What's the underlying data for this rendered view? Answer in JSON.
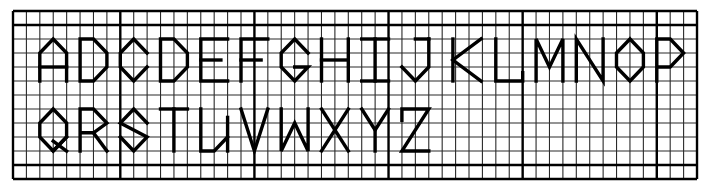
{
  "grid": {
    "left": 13,
    "top": 11,
    "cols": 51,
    "rows": 12,
    "cell_w": 13.412,
    "cell_h": 14,
    "heavy_cols": [
      0,
      8,
      18,
      28,
      38,
      48,
      51
    ],
    "heavy_rows": [
      0,
      1,
      11,
      12
    ],
    "line_color": "#2a2a2a",
    "heavy_color": "#000000",
    "stroke_color": "#000000"
  },
  "rows": [
    {
      "label": "row-1",
      "letters": "ABCDEFGHIJKLMNOP"
    },
    {
      "label": "row-2",
      "letters": "QRSTUVWXYZ"
    }
  ],
  "glyphs": [
    {
      "ch": "A",
      "c": 2,
      "r": 2,
      "paths": [
        [
          [
            0,
            3
          ],
          [
            0,
            1
          ],
          [
            1,
            0
          ],
          [
            2,
            1
          ],
          [
            2,
            3
          ]
        ],
        [
          [
            0,
            2
          ],
          [
            2,
            2
          ]
        ]
      ]
    },
    {
      "ch": "B",
      "c": 5,
      "r": 2,
      "paths": [
        [
          [
            0,
            0
          ],
          [
            0,
            3
          ],
          [
            1,
            3
          ],
          [
            2,
            2
          ],
          [
            2,
            1
          ],
          [
            1,
            0
          ],
          [
            0,
            0
          ]
        ]
      ]
    },
    {
      "ch": "C",
      "c": 8,
      "r": 2,
      "paths": [
        [
          [
            2,
            1
          ],
          [
            1,
            0
          ],
          [
            0,
            1
          ],
          [
            0,
            2
          ],
          [
            1,
            3
          ],
          [
            2,
            2
          ]
        ]
      ]
    },
    {
      "ch": "D",
      "c": 11,
      "r": 2,
      "paths": [
        [
          [
            0,
            0
          ],
          [
            0,
            3
          ],
          [
            1,
            3
          ],
          [
            2,
            2
          ],
          [
            2,
            1
          ],
          [
            1,
            0
          ],
          [
            0,
            0
          ]
        ]
      ]
    },
    {
      "ch": "E",
      "c": 14,
      "r": 2,
      "paths": [
        [
          [
            2,
            0
          ],
          [
            0,
            0
          ],
          [
            0,
            3
          ],
          [
            2,
            3
          ]
        ],
        [
          [
            0,
            1.5
          ],
          [
            1.5,
            1.5
          ]
        ]
      ]
    },
    {
      "ch": "F",
      "c": 17,
      "r": 2,
      "paths": [
        [
          [
            2,
            0
          ],
          [
            0,
            0
          ],
          [
            0,
            3
          ]
        ],
        [
          [
            0,
            1.5
          ],
          [
            1.5,
            1.5
          ]
        ]
      ]
    },
    {
      "ch": "G",
      "c": 20,
      "r": 2,
      "paths": [
        [
          [
            2,
            1
          ],
          [
            1,
            0
          ],
          [
            0,
            1
          ],
          [
            0,
            2
          ],
          [
            1,
            3
          ],
          [
            2,
            2
          ],
          [
            1,
            2
          ]
        ]
      ]
    },
    {
      "ch": "H",
      "c": 23,
      "r": 2,
      "paths": [
        [
          [
            0,
            0
          ],
          [
            0,
            3
          ]
        ],
        [
          [
            2,
            0
          ],
          [
            2,
            3
          ]
        ],
        [
          [
            0,
            1.5
          ],
          [
            2,
            1.5
          ]
        ]
      ]
    },
    {
      "ch": "I",
      "c": 26,
      "r": 2,
      "paths": [
        [
          [
            0,
            0
          ],
          [
            2,
            0
          ]
        ],
        [
          [
            1,
            0
          ],
          [
            1,
            3
          ]
        ],
        [
          [
            0,
            3
          ],
          [
            2,
            3
          ]
        ]
      ]
    },
    {
      "ch": "J",
      "c": 29,
      "r": 2,
      "paths": [
        [
          [
            1,
            0
          ],
          [
            2,
            0
          ]
        ],
        [
          [
            2,
            0
          ],
          [
            2,
            2
          ],
          [
            1,
            3
          ],
          [
            0,
            2
          ]
        ]
      ]
    },
    {
      "ch": "K",
      "c": 33,
      "r": 2,
      "paths": [
        [
          [
            -0.2,
            0
          ],
          [
            -0.2,
            3
          ]
        ],
        [
          [
            1.9,
            0
          ],
          [
            -0.2,
            1.5
          ],
          [
            1.9,
            3
          ]
        ]
      ]
    },
    {
      "ch": "L",
      "c": 36,
      "r": 2,
      "paths": [
        [
          [
            0,
            0
          ],
          [
            0,
            3
          ],
          [
            2,
            3
          ],
          [
            2,
            2.4
          ]
        ]
      ]
    },
    {
      "ch": "M",
      "c": 39,
      "r": 2,
      "paths": [
        [
          [
            0,
            3
          ],
          [
            0,
            0
          ],
          [
            1,
            2
          ],
          [
            2,
            0
          ],
          [
            2,
            3
          ]
        ]
      ]
    },
    {
      "ch": "N",
      "c": 42,
      "r": 2,
      "paths": [
        [
          [
            0,
            3
          ],
          [
            0,
            0
          ],
          [
            2,
            3
          ],
          [
            2,
            0
          ]
        ]
      ]
    },
    {
      "ch": "O",
      "c": 45,
      "r": 2,
      "paths": [
        [
          [
            1,
            0
          ],
          [
            2,
            1
          ],
          [
            2,
            2
          ],
          [
            1,
            3
          ],
          [
            0,
            2
          ],
          [
            0,
            1
          ],
          [
            1,
            0
          ]
        ]
      ]
    },
    {
      "ch": "P",
      "c": 48,
      "r": 2,
      "paths": [
        [
          [
            0,
            3
          ],
          [
            0,
            0
          ],
          [
            1,
            0
          ],
          [
            2,
            1
          ],
          [
            1,
            2
          ],
          [
            0,
            2
          ]
        ]
      ]
    },
    {
      "ch": "Q",
      "c": 2,
      "r": 7,
      "paths": [
        [
          [
            1,
            0
          ],
          [
            2,
            1
          ],
          [
            2,
            2
          ],
          [
            1,
            3
          ],
          [
            0,
            2
          ],
          [
            0,
            1
          ],
          [
            1,
            0
          ]
        ],
        [
          [
            1,
            3
          ],
          [
            2,
            2
          ]
        ],
        [
          [
            1,
            2.3
          ],
          [
            2,
            3
          ]
        ]
      ]
    },
    {
      "ch": "R",
      "c": 5,
      "r": 7,
      "paths": [
        [
          [
            0,
            3
          ],
          [
            0,
            0
          ],
          [
            1,
            0
          ],
          [
            2,
            1
          ],
          [
            1,
            1.7
          ],
          [
            0,
            1.7
          ]
        ],
        [
          [
            1,
            1.7
          ],
          [
            2,
            3
          ]
        ]
      ]
    },
    {
      "ch": "S",
      "c": 8,
      "r": 7,
      "paths": [
        [
          [
            2,
            1
          ],
          [
            1,
            0
          ],
          [
            0,
            1
          ],
          [
            2,
            2
          ],
          [
            1,
            3
          ],
          [
            0,
            2
          ]
        ]
      ]
    },
    {
      "ch": "T",
      "c": 11,
      "r": 7,
      "paths": [
        [
          [
            0,
            0
          ],
          [
            2,
            0
          ]
        ],
        [
          [
            1,
            0
          ],
          [
            1,
            3
          ]
        ]
      ]
    },
    {
      "ch": "U",
      "c": 14,
      "r": 7,
      "paths": [
        [
          [
            0,
            0
          ],
          [
            0,
            3
          ],
          [
            1,
            3
          ],
          [
            2,
            2
          ]
        ],
        [
          [
            2,
            0.6
          ],
          [
            2,
            3
          ]
        ]
      ]
    },
    {
      "ch": "V",
      "c": 17,
      "r": 7,
      "paths": [
        [
          [
            0,
            0
          ],
          [
            1,
            3
          ],
          [
            2,
            0
          ]
        ]
      ]
    },
    {
      "ch": "W",
      "c": 20,
      "r": 7,
      "paths": [
        [
          [
            0,
            0
          ],
          [
            0,
            3
          ],
          [
            1,
            1
          ],
          [
            2,
            3
          ],
          [
            2,
            0
          ]
        ]
      ]
    },
    {
      "ch": "X",
      "c": 23,
      "r": 7,
      "paths": [
        [
          [
            0,
            0
          ],
          [
            2,
            3
          ]
        ],
        [
          [
            2,
            0
          ],
          [
            0,
            3
          ]
        ]
      ]
    },
    {
      "ch": "Y",
      "c": 26,
      "r": 7,
      "paths": [
        [
          [
            0,
            0
          ],
          [
            1,
            1.5
          ],
          [
            2,
            0
          ]
        ],
        [
          [
            1,
            1.5
          ],
          [
            1,
            3
          ]
        ]
      ]
    },
    {
      "ch": "Z",
      "c": 29,
      "r": 7,
      "paths": [
        [
          [
            0,
            0.8
          ],
          [
            0,
            0
          ],
          [
            2,
            0
          ],
          [
            0,
            3
          ],
          [
            2,
            3
          ]
        ]
      ]
    }
  ]
}
